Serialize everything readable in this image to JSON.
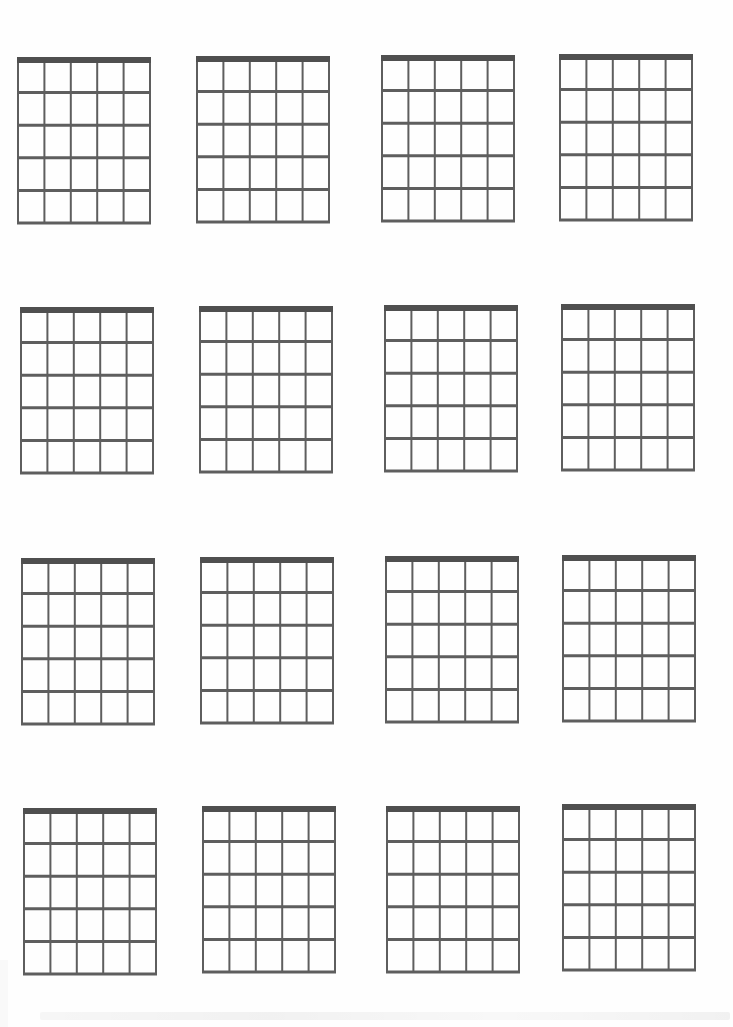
{
  "document": {
    "type": "blank-chord-chart-sheet",
    "layout": {
      "rows": 4,
      "columns": 4
    },
    "chord_box": {
      "strings": 6,
      "frets": 5,
      "nut": true,
      "width": 134,
      "height": 168,
      "line_color": "#5e5e5e",
      "nut_color": "#4f4f4f",
      "nut_thickness": 6,
      "string_thickness": 2,
      "fret_thickness": 3
    },
    "boxes": [
      {
        "row": 1,
        "col": 1,
        "x": 17,
        "y": 57
      },
      {
        "row": 1,
        "col": 2,
        "x": 196,
        "y": 56
      },
      {
        "row": 1,
        "col": 3,
        "x": 381,
        "y": 55
      },
      {
        "row": 1,
        "col": 4,
        "x": 559,
        "y": 54
      },
      {
        "row": 2,
        "col": 1,
        "x": 20,
        "y": 307
      },
      {
        "row": 2,
        "col": 2,
        "x": 199,
        "y": 306
      },
      {
        "row": 2,
        "col": 3,
        "x": 384,
        "y": 305
      },
      {
        "row": 2,
        "col": 4,
        "x": 561,
        "y": 304
      },
      {
        "row": 3,
        "col": 1,
        "x": 21,
        "y": 558
      },
      {
        "row": 3,
        "col": 2,
        "x": 200,
        "y": 557
      },
      {
        "row": 3,
        "col": 3,
        "x": 385,
        "y": 556
      },
      {
        "row": 3,
        "col": 4,
        "x": 562,
        "y": 555
      },
      {
        "row": 4,
        "col": 1,
        "x": 23,
        "y": 808
      },
      {
        "row": 4,
        "col": 2,
        "x": 202,
        "y": 806
      },
      {
        "row": 4,
        "col": 3,
        "x": 386,
        "y": 806
      },
      {
        "row": 4,
        "col": 4,
        "x": 562,
        "y": 804
      }
    ]
  }
}
